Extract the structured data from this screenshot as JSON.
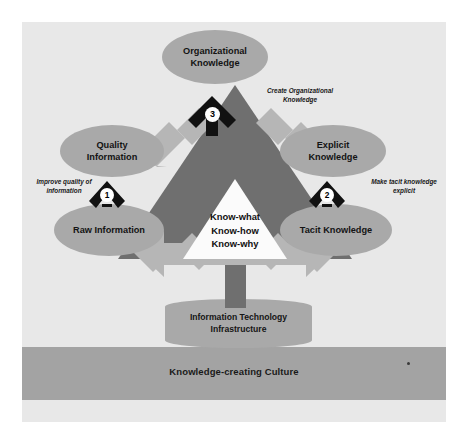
{
  "figure": {
    "nodes": {
      "organizational_knowledge": "Organizational\nKnowledge",
      "quality_information": "Quality\nInformation",
      "raw_information": "Raw Information",
      "explicit_knowledge": "Explicit\nKnowledge",
      "tacit_knowledge": "Tacit Knowledge"
    },
    "core": {
      "line1": "Know-what",
      "line2": "Know-how",
      "line3": "Know-why"
    },
    "annotations": [
      {
        "number": "1",
        "text": "Improve quality of\ninformation"
      },
      {
        "number": "2",
        "text": "Make tacit knowledge\nexplicit"
      },
      {
        "number": "3",
        "text": "Create Organizational\nKnowledge"
      }
    ],
    "foundation": {
      "it_infrastructure": "Information Technology\nInfrastructure",
      "culture": "Knowledge-creating Culture"
    },
    "colors": {
      "plate": "#e8e8e8",
      "node_fill": "#a9a9a9",
      "triangle_dark": "#6f6f6f",
      "arrow_light": "#b6b6b6",
      "culture_band": "#a3a3a3",
      "core_fill": "#fbfbfb",
      "marker_black": "#111111",
      "text": "#141414"
    }
  }
}
